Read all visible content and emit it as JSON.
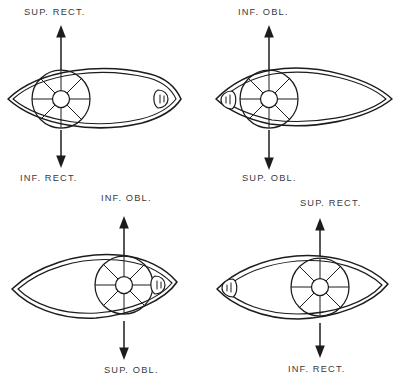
{
  "figure": {
    "background_color": "#ffffff",
    "ink_color": "#1c1c1c",
    "text_color": "#3a3a3a"
  },
  "panels": [
    {
      "id": "top-left",
      "eye_side": "left-eye",
      "iris_position": "left",
      "caruncle_position": "right",
      "iris_spokes": 8,
      "up_label": "SUP. RECT.",
      "down_label": "INF. RECT.",
      "up_label_x": 24,
      "down_label_x": 20,
      "up_arrow_direction": "up",
      "down_arrow_direction": "down"
    },
    {
      "id": "top-right",
      "eye_side": "right-eye",
      "iris_position": "left",
      "caruncle_position": "right",
      "iris_spokes": 8,
      "up_label": "INF. OBL.",
      "down_label": "SUP. OBL.",
      "up_label_x": 38,
      "down_label_x": 42,
      "up_arrow_direction": "up",
      "down_arrow_direction": "down"
    },
    {
      "id": "bottom-left",
      "eye_side": "left-eye",
      "iris_position": "right",
      "caruncle_position": "right",
      "iris_spokes": 8,
      "up_label": "INF. OBL.",
      "down_label": "SUP. OBL.",
      "up_label_x": 101,
      "down_label_x": 104,
      "up_arrow_direction": "up",
      "down_arrow_direction": "down"
    },
    {
      "id": "bottom-right",
      "eye_side": "right-eye",
      "iris_position": "right",
      "caruncle_position": "left",
      "iris_spokes": 8,
      "up_label": "SUP. RECT.",
      "down_label": "INF. RECT.",
      "up_label_x": 100,
      "down_label_x": 88,
      "up_arrow_direction": "up",
      "down_arrow_direction": "down"
    }
  ],
  "legend": {
    "muscle_names": [
      "SUP. RECT.",
      "INF. RECT.",
      "SUP. OBL.",
      "INF. OBL."
    ]
  }
}
